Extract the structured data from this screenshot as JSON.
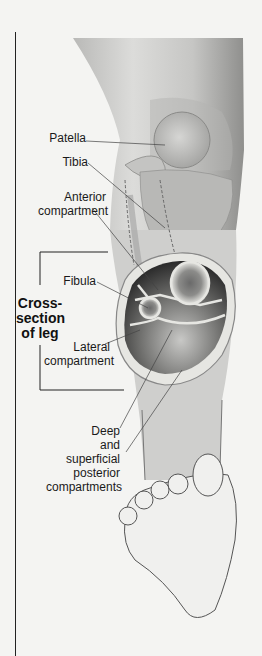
{
  "figure": {
    "labels": {
      "patella": "Patella",
      "tibia": "Tibia",
      "anterior_compartment": [
        "Anterior",
        "compartment"
      ],
      "fibula": "Fibula",
      "cross_section": [
        "Cross-",
        "section",
        "of leg"
      ],
      "lateral_compartment": [
        "Lateral",
        "compartment"
      ],
      "posterior_compartments": [
        "Deep",
        "and",
        "superficial",
        "posterior",
        "compartments"
      ]
    },
    "colors": {
      "background": "#f4f4f2",
      "skin_light": "#d8d8d6",
      "skin_dark": "#9a9a98",
      "bone": "#e8e8e4",
      "marrow": "#777777",
      "muscle_dark": "#3a3a3a",
      "line": "#333333"
    }
  }
}
